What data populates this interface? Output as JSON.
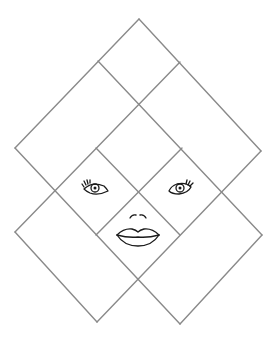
{
  "diagram": {
    "line_color": "#8a8a8a",
    "feature_color": "#1a1a1a",
    "background": "#ffffff",
    "lines": [
      {
        "id": "A",
        "x1": 139,
        "y1": 19,
        "x2": 261,
        "y2": 151
      },
      {
        "id": "B",
        "x1": 98,
        "y1": 61,
        "x2": 262,
        "y2": 235
      },
      {
        "id": "C",
        "x1": 15,
        "y1": 148,
        "x2": 180,
        "y2": 324
      },
      {
        "id": "D",
        "x1": 96,
        "y1": 148,
        "x2": 180,
        "y2": 235
      },
      {
        "id": "J",
        "x1": 15,
        "y1": 232,
        "x2": 97,
        "y2": 322
      },
      {
        "id": "E",
        "x1": 139,
        "y1": 19,
        "x2": 15,
        "y2": 148
      },
      {
        "id": "F",
        "x1": 180,
        "y1": 62,
        "x2": 15,
        "y2": 232
      },
      {
        "id": "G",
        "x1": 261,
        "y1": 151,
        "x2": 97,
        "y2": 322
      },
      {
        "id": "H",
        "x1": 182,
        "y1": 148,
        "x2": 96,
        "y2": 235
      },
      {
        "id": "I",
        "x1": 262,
        "y1": 235,
        "x2": 180,
        "y2": 324
      }
    ],
    "features": {
      "left_eye": {
        "cx": 96,
        "cy": 188,
        "label": "left-eye"
      },
      "right_eye": {
        "cx": 180,
        "cy": 188,
        "label": "right-eye"
      },
      "nose": {
        "cx": 138,
        "cy": 216,
        "label": "nose"
      },
      "mouth": {
        "cx": 138,
        "cy": 236,
        "label": "lips"
      }
    }
  }
}
